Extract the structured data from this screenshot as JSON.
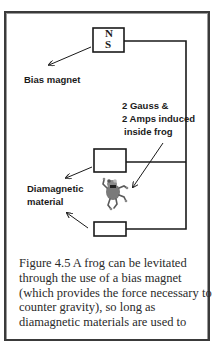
{
  "figure": {
    "magnet": {
      "north": "N",
      "south": "S"
    },
    "labels": {
      "bias_magnet": "Bias magnet",
      "induced_lines": [
        "2 Gauss &",
        "2 Amps induced",
        "inside frog"
      ],
      "diamagnetic_lines": [
        "Diamagnetic",
        "material"
      ]
    },
    "frog_icon": "frog-icon"
  },
  "caption": {
    "lines": [
      "Figure 4.5 A frog can be levitated",
      "through the use of a bias magnet",
      "(which provides the force necessary to",
      "counter gravity), so long as",
      "diamagnetic materials are used to"
    ]
  },
  "colors": {
    "line": "#1a1a1a",
    "frame": "#3a3a3a",
    "text": "#2a2a2a"
  }
}
